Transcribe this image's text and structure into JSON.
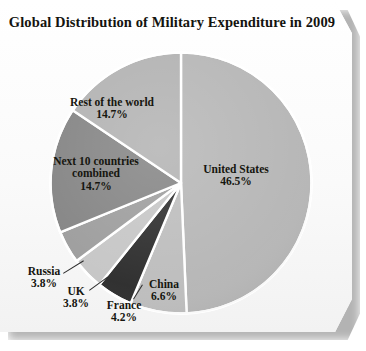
{
  "card": {
    "title": "Global Distribution of Military Expenditure in 2009"
  },
  "chart_data": {
    "type": "pie",
    "title": "Global Distribution of Military Expenditure in 2009",
    "xlabel": "",
    "ylabel": "",
    "units": "percent",
    "legend_position": "none",
    "grid": false,
    "start_angle_deg": 0,
    "direction": "clockwise",
    "categories": [
      "United States",
      "China",
      "France",
      "UK",
      "Russia",
      "Next 10 countries combined",
      "Rest of the world"
    ],
    "values": [
      46.5,
      6.6,
      4.2,
      3.8,
      3.8,
      14.7,
      14.7
    ],
    "value_labels": [
      "46.5%",
      "6.6%",
      "4.2%",
      "3.8%",
      "3.8%",
      "14.7%",
      "14.7%"
    ],
    "colors": [
      "#b6b6b6",
      "#bdbdbd",
      "#2d2d2d",
      "#c6c6c6",
      "#9d9d9d",
      "#848484",
      "#b2b2b2"
    ],
    "slices": [
      {
        "name": "United States",
        "label_line1": "United States",
        "label_line2": "",
        "percent_label": "46.5%",
        "value": 46.5,
        "color": "#b6b6b6"
      },
      {
        "name": "China",
        "label_line1": "China",
        "label_line2": "",
        "percent_label": "6.6%",
        "value": 6.6,
        "color": "#bdbdbd"
      },
      {
        "name": "France",
        "label_line1": "France",
        "label_line2": "",
        "percent_label": "4.2%",
        "value": 4.2,
        "color": "#2d2d2d"
      },
      {
        "name": "UK",
        "label_line1": "UK",
        "label_line2": "",
        "percent_label": "3.8%",
        "value": 3.8,
        "color": "#c6c6c6"
      },
      {
        "name": "Russia",
        "label_line1": "Russia",
        "label_line2": "",
        "percent_label": "3.8%",
        "value": 3.8,
        "color": "#9d9d9d"
      },
      {
        "name": "Next 10 countries combined",
        "label_line1": "Next 10 countries",
        "label_line2": "combined",
        "percent_label": "14.7%",
        "value": 14.7,
        "color": "#848484"
      },
      {
        "name": "Rest of the world",
        "label_line1": "Rest of the world",
        "label_line2": "",
        "percent_label": "14.7%",
        "value": 14.7,
        "color": "#b2b2b2"
      }
    ]
  },
  "colors": {
    "paper": "#fbfbfb",
    "title_text": "#14140f",
    "label_text": "#16160f",
    "slice_separator": "#ffffff",
    "pie_outline": "#ffffff"
  }
}
